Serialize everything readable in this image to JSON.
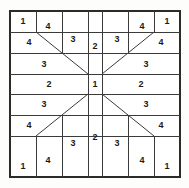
{
  "figure": {
    "type": "geometric-partition-diagram",
    "symmetry": "4-fold (horizontal and vertical mirror)",
    "frame": {
      "x": 10,
      "y": 11,
      "width": 170,
      "height": 166,
      "line_color": "#2b2b2b",
      "fill_color": "#ffffff",
      "background_color": "#fdfdfb"
    },
    "columns_x": [
      10,
      36,
      62,
      88,
      102,
      128,
      154,
      180
    ],
    "rows_y": [
      11,
      32,
      53,
      74,
      94,
      115,
      136,
      177
    ],
    "center_cell": {
      "x0": 88,
      "y0": 74,
      "x1": 102,
      "y1": 94,
      "label": "1"
    }
  },
  "regions": [
    {
      "id": "tl-corner-1",
      "label": "1",
      "cx": 23,
      "cy": 21
    },
    {
      "id": "tl-upper-4",
      "label": "4",
      "cx": 48,
      "cy": 26
    },
    {
      "id": "tl-left-4",
      "label": "4",
      "cx": 29,
      "cy": 42
    },
    {
      "id": "tl-col3-3",
      "label": "3",
      "cx": 73,
      "cy": 39
    },
    {
      "id": "tl-band3-3",
      "label": "3",
      "cx": 44,
      "cy": 64
    },
    {
      "id": "top-center-2",
      "label": "2",
      "cx": 95,
      "cy": 46
    },
    {
      "id": "tr-col5-3",
      "label": "3",
      "cx": 117,
      "cy": 39
    },
    {
      "id": "tr-upper-4",
      "label": "4",
      "cx": 142,
      "cy": 26
    },
    {
      "id": "tr-corner-1",
      "label": "1",
      "cx": 167,
      "cy": 21
    },
    {
      "id": "tr-right-4",
      "label": "4",
      "cx": 161,
      "cy": 42
    },
    {
      "id": "tr-band3-3",
      "label": "3",
      "cx": 146,
      "cy": 64
    },
    {
      "id": "mid-left-2",
      "label": "2",
      "cx": 49,
      "cy": 84
    },
    {
      "id": "mid-center-1",
      "label": "1",
      "cx": 95,
      "cy": 84
    },
    {
      "id": "mid-right-2",
      "label": "2",
      "cx": 141,
      "cy": 84
    },
    {
      "id": "bl-band3-3",
      "label": "3",
      "cx": 44,
      "cy": 104
    },
    {
      "id": "bl-left-4",
      "label": "4",
      "cx": 29,
      "cy": 125
    },
    {
      "id": "bl-corner-1",
      "label": "1",
      "cx": 23,
      "cy": 166
    },
    {
      "id": "bl-lower-4",
      "label": "4",
      "cx": 48,
      "cy": 160
    },
    {
      "id": "bl-col3-3",
      "label": "3",
      "cx": 73,
      "cy": 143
    },
    {
      "id": "bot-center-2",
      "label": "2",
      "cx": 95,
      "cy": 137
    },
    {
      "id": "br-col5-3",
      "label": "3",
      "cx": 117,
      "cy": 143
    },
    {
      "id": "br-lower-4",
      "label": "4",
      "cx": 142,
      "cy": 160
    },
    {
      "id": "br-corner-1",
      "label": "1",
      "cx": 167,
      "cy": 166
    },
    {
      "id": "br-right-4",
      "label": "4",
      "cx": 161,
      "cy": 125
    },
    {
      "id": "br-band3-3",
      "label": "3",
      "cx": 146,
      "cy": 104
    }
  ],
  "lines": {
    "horizontal": [
      {
        "id": "h-row1",
        "x1": 10,
        "y1": 32,
        "x2": 180,
        "y2": 32
      },
      {
        "id": "h-row2",
        "x1": 10,
        "y1": 53,
        "x2": 180,
        "y2": 53
      },
      {
        "id": "h-row3",
        "x1": 10,
        "y1": 74,
        "x2": 180,
        "y2": 74
      },
      {
        "id": "h-row4",
        "x1": 10,
        "y1": 94,
        "x2": 180,
        "y2": 94
      },
      {
        "id": "h-row5",
        "x1": 10,
        "y1": 115,
        "x2": 180,
        "y2": 115
      },
      {
        "id": "h-row6",
        "x1": 10,
        "y1": 136,
        "x2": 180,
        "y2": 136
      }
    ],
    "vertical": [
      {
        "id": "v-col1-top",
        "x1": 36,
        "y1": 11,
        "x2": 36,
        "y2": 32
      },
      {
        "id": "v-col1-bot",
        "x1": 36,
        "y1": 136,
        "x2": 36,
        "y2": 177
      },
      {
        "id": "v-col2-top",
        "x1": 62,
        "y1": 11,
        "x2": 62,
        "y2": 53
      },
      {
        "id": "v-col2-bot",
        "x1": 62,
        "y1": 115,
        "x2": 62,
        "y2": 177
      },
      {
        "id": "v-col3-full",
        "x1": 88,
        "y1": 11,
        "x2": 88,
        "y2": 177
      },
      {
        "id": "v-col4-full",
        "x1": 102,
        "y1": 11,
        "x2": 102,
        "y2": 177
      },
      {
        "id": "v-col5-top",
        "x1": 128,
        "y1": 11,
        "x2": 128,
        "y2": 53
      },
      {
        "id": "v-col5-bot",
        "x1": 128,
        "y1": 115,
        "x2": 128,
        "y2": 177
      },
      {
        "id": "v-col6-top",
        "x1": 154,
        "y1": 11,
        "x2": 154,
        "y2": 32
      },
      {
        "id": "v-col6-bot",
        "x1": 154,
        "y1": 136,
        "x2": 154,
        "y2": 177
      }
    ],
    "diagonals": [
      {
        "id": "diag-top-left",
        "x1": 36,
        "y1": 32,
        "x2": 88,
        "y2": 74
      },
      {
        "id": "diag-top-right",
        "x1": 154,
        "y1": 32,
        "x2": 102,
        "y2": 74
      },
      {
        "id": "diag-bottom-left",
        "x1": 36,
        "y1": 136,
        "x2": 88,
        "y2": 94
      },
      {
        "id": "diag-bottom-right",
        "x1": 154,
        "y1": 136,
        "x2": 102,
        "y2": 94
      }
    ]
  }
}
